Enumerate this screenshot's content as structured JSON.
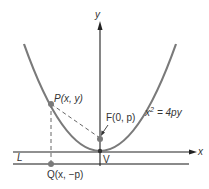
{
  "diagram": {
    "type": "parabola-focus-directrix",
    "axes": {
      "x_label": "x",
      "y_label": "y"
    },
    "equation": {
      "lhs": "x",
      "exponent": "2",
      "rhs": "= 4py"
    },
    "points": {
      "P": {
        "label": "P(x, y)"
      },
      "F": {
        "label": "F(0, p)"
      },
      "V": {
        "label": "V"
      },
      "Q": {
        "label": "Q(x, −p)"
      }
    },
    "directrix": {
      "label": "L"
    },
    "colors": {
      "curve": "#777777",
      "axis": "#222222",
      "directrix": "#888888",
      "point": "#7a7a7a"
    }
  }
}
